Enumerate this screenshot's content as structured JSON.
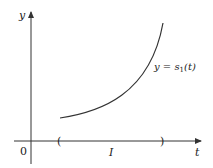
{
  "diagram": {
    "axes": {
      "x_label": "t",
      "y_label": "y",
      "origin_label": "0"
    },
    "curve": {
      "label_prefix": "y = s",
      "label_subscript": "1",
      "label_suffix": "(t)",
      "shape": "increasing convex"
    },
    "interval": {
      "label": "I",
      "left_bracket": "(",
      "right_bracket": ")"
    },
    "colors": {
      "ink": "#333333"
    }
  }
}
